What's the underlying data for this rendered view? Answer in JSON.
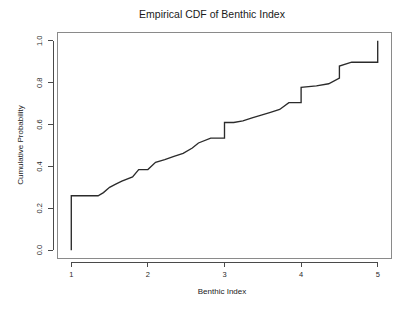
{
  "chart_data": {
    "type": "line",
    "subtype": "ecdf-step",
    "title": "Empirical CDF of Benthic Index",
    "xlabel": "Benthic Index",
    "ylabel": "Cumulative Probability",
    "xlim": [
      0.82,
      5.18
    ],
    "ylim": [
      -0.04,
      1.04
    ],
    "xticks": [
      1,
      2,
      3,
      4,
      5
    ],
    "xtick_labels": [
      "1",
      "2",
      "3",
      "4",
      "5"
    ],
    "yticks": [
      0.0,
      0.2,
      0.4,
      0.6,
      0.8,
      1.0
    ],
    "ytick_labels": [
      "0.0",
      "0.2",
      "0.4",
      "0.6",
      "0.8",
      "1.0"
    ],
    "grid": false,
    "legend": false,
    "line_color": "#2b2b2b",
    "box_color": "#8a8a8a",
    "axis_color": "#4a4a4a",
    "background": "#ffffff",
    "x": [
      1.0,
      1.0,
      1.35,
      1.42,
      1.5,
      1.58,
      1.66,
      1.8,
      1.88,
      2.0,
      2.1,
      2.22,
      2.34,
      2.46,
      2.58,
      2.66,
      2.82,
      3.0,
      3.0,
      3.12,
      3.24,
      3.36,
      3.48,
      3.6,
      3.72,
      3.84,
      4.0,
      4.0,
      4.2,
      4.36,
      4.5,
      4.5,
      4.66,
      5.0,
      5.0
    ],
    "y": [
      0.0,
      0.26,
      0.26,
      0.275,
      0.3,
      0.315,
      0.33,
      0.35,
      0.385,
      0.385,
      0.42,
      0.432,
      0.448,
      0.462,
      0.488,
      0.512,
      0.535,
      0.535,
      0.61,
      0.61,
      0.618,
      0.632,
      0.645,
      0.658,
      0.672,
      0.705,
      0.705,
      0.778,
      0.785,
      0.795,
      0.822,
      0.88,
      0.898,
      0.898,
      1.0
    ]
  }
}
